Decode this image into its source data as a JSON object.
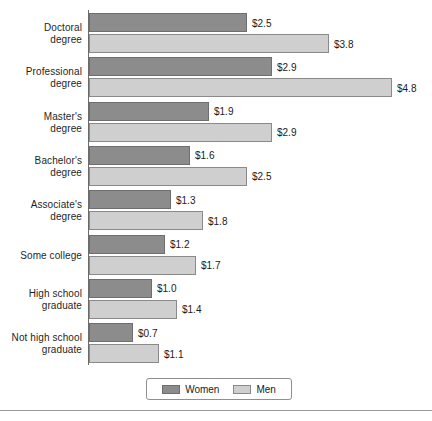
{
  "chart_data": {
    "type": "bar",
    "orientation": "horizontal",
    "title": "",
    "subtitle": "",
    "xlabel": "",
    "ylabel": "",
    "grid": false,
    "legend_position": "bottom",
    "xlim": [
      0,
      5.4
    ],
    "value_prefix": "$",
    "categories": [
      "Doctoral degree",
      "Professional degree",
      "Master's degree",
      "Bachelor's degree",
      "Associate's degree",
      "Some college",
      "High school graduate",
      "Not high school graduate"
    ],
    "category_lines": [
      [
        "Doctoral",
        "degree"
      ],
      [
        "Professional",
        "degree"
      ],
      [
        "Master's",
        "degree"
      ],
      [
        "Bachelor's",
        "degree"
      ],
      [
        "Associate's",
        "degree"
      ],
      [
        "Some college"
      ],
      [
        "High school",
        "graduate"
      ],
      [
        "Not high school",
        "graduate"
      ]
    ],
    "series": [
      {
        "name": "Women",
        "color": "#8c8c8c",
        "values": [
          2.5,
          2.9,
          1.9,
          1.6,
          1.3,
          1.2,
          1.0,
          0.7
        ],
        "labels": [
          "$2.5",
          "$2.9",
          "$1.9",
          "$1.6",
          "$1.3",
          "$1.2",
          "$1.0",
          "$0.7"
        ]
      },
      {
        "name": "Men",
        "color": "#cfcfcf",
        "values": [
          3.8,
          4.8,
          2.9,
          2.5,
          1.8,
          1.7,
          1.4,
          1.1
        ],
        "labels": [
          "$3.8",
          "$4.8",
          "$2.9",
          "$2.5",
          "$1.8",
          "$1.7",
          "$1.4",
          "$1.1"
        ]
      }
    ]
  },
  "legend": {
    "items": [
      {
        "label": "Women",
        "color": "#8c8c8c"
      },
      {
        "label": "Men",
        "color": "#cfcfcf"
      }
    ]
  }
}
